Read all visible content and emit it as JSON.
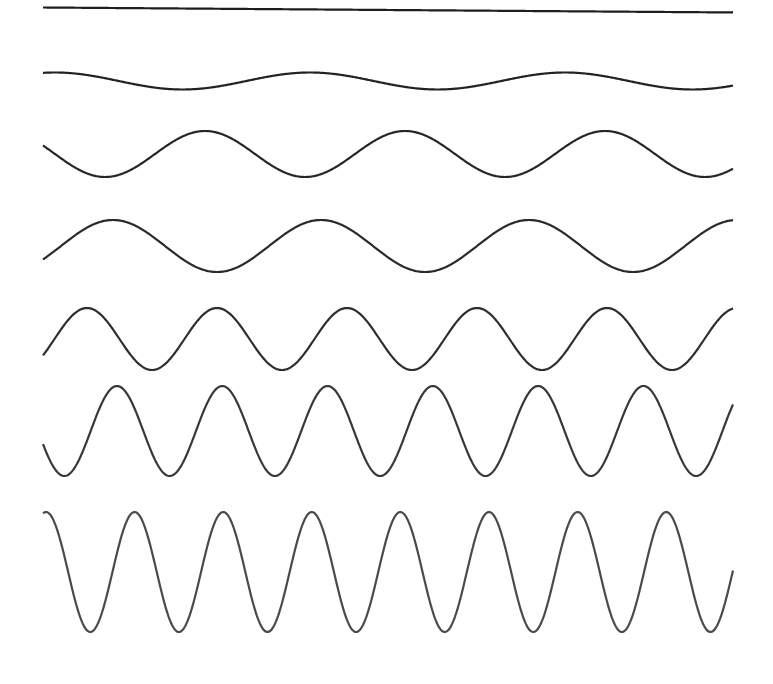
{
  "diagram": {
    "title": "",
    "stroke_color": "#2a2a2a",
    "background": "#ffffff",
    "x_start": 43,
    "x_end": 733,
    "waves": [
      {
        "name": "wave-1-flat",
        "center_y": 7.5,
        "amplitude": 0,
        "period": 0,
        "first_peak_x": 0,
        "slope": 0.0072,
        "color": "#1e1e1e",
        "width": 2.2
      },
      {
        "name": "wave-2",
        "center_y": 81,
        "amplitude": 8.5,
        "period": 255,
        "first_peak_x": 55,
        "color": "#222222",
        "width": 2.2
      },
      {
        "name": "wave-3",
        "center_y": 154,
        "amplitude": 23,
        "period": 200,
        "first_peak_x": 205,
        "color": "#262626",
        "width": 2.2
      },
      {
        "name": "wave-4",
        "center_y": 246,
        "amplitude": 26,
        "period": 208,
        "first_peak_x": 113,
        "color": "#2a2a2a",
        "width": 2.2
      },
      {
        "name": "wave-5",
        "center_y": 339,
        "amplitude": 31,
        "period": 130,
        "first_peak_x": 87,
        "color": "#2e2e2e",
        "width": 2.2
      },
      {
        "name": "wave-6",
        "center_y": 431,
        "amplitude": 45,
        "period": 105.3,
        "first_peak_x": 117,
        "color": "#383838",
        "width": 2.2
      },
      {
        "name": "wave-7",
        "center_y": 572,
        "amplitude": 60,
        "period": 88.6,
        "first_peak_x": 46,
        "color": "#4a4a4a",
        "width": 2.2
      }
    ]
  }
}
